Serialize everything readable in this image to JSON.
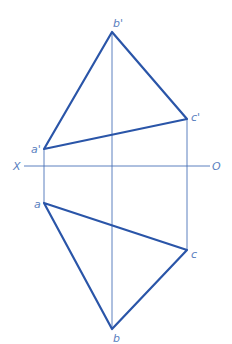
{
  "diagram": {
    "type": "orthographic-projection-triangle",
    "colors": {
      "object_line": "#2a55a8",
      "projection_line": "#4a72b8",
      "label": "#5a7fc0"
    },
    "axis": {
      "left_label": "X",
      "right_label": "O"
    },
    "front_view": {
      "vertices": [
        {
          "label": "a'",
          "x": 44,
          "y": 149
        },
        {
          "label": "b'",
          "x": 112,
          "y": 32
        },
        {
          "label": "c'",
          "x": 187,
          "y": 119
        }
      ]
    },
    "top_view": {
      "vertices": [
        {
          "label": "a",
          "x": 44,
          "y": 203
        },
        {
          "label": "b",
          "x": 112,
          "y": 329
        },
        {
          "label": "c",
          "x": 187,
          "y": 250
        }
      ]
    },
    "labels": {
      "a_prime": "a'",
      "b_prime": "b'",
      "c_prime": "c'",
      "a": "a",
      "b": "b",
      "c": "c",
      "x": "X",
      "o": "O"
    }
  }
}
